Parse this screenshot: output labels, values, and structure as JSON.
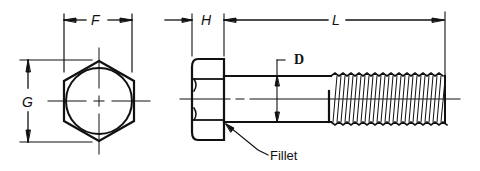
{
  "figure": {
    "views": [
      "end-view",
      "side-view"
    ],
    "labels": {
      "F": "F",
      "G": "G",
      "H": "H",
      "L": "L",
      "D": "D",
      "fillet": "Fillet"
    },
    "line_color": "#111111",
    "background": "#ffffff"
  }
}
